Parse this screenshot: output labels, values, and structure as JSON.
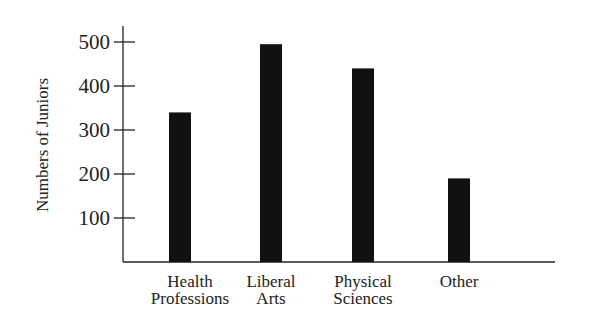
{
  "chart_data": {
    "type": "bar",
    "title": "",
    "xlabel": "",
    "ylabel": "Numbers of Juniors",
    "categories": [
      "Health Professions",
      "Liberal Arts",
      "Physical Sciences",
      "Other"
    ],
    "category_lines": [
      [
        "Health",
        "Professions"
      ],
      [
        "Liberal",
        "Arts"
      ],
      [
        "Physical",
        "Sciences"
      ],
      [
        "Other"
      ]
    ],
    "values": [
      340,
      495,
      440,
      190
    ],
    "yticks": [
      100,
      200,
      300,
      400,
      500
    ],
    "ylim": [
      0,
      530
    ],
    "grid": false,
    "legend": null,
    "bar_color": "#111111",
    "axis_color": "#222222"
  }
}
